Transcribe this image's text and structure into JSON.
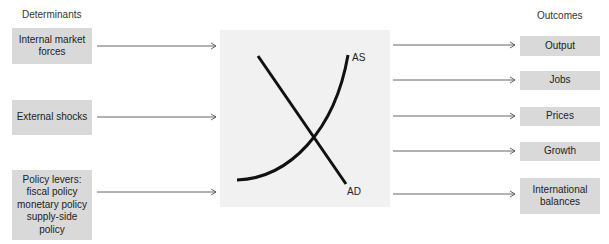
{
  "headings": {
    "determinants": "Determinants",
    "outcomes": "Outcomes"
  },
  "determinants": [
    {
      "label": "Internal market\nforces"
    },
    {
      "label": "External shocks"
    },
    {
      "label": "Policy levers:\nfiscal policy\nmonetary policy\nsupply-side\npolicy"
    }
  ],
  "outcomes": [
    {
      "label": "Output"
    },
    {
      "label": "Jobs"
    },
    {
      "label": "Prices"
    },
    {
      "label": "Growth"
    },
    {
      "label": "International\nbalances"
    }
  ],
  "diagram": {
    "as_label": "AS",
    "ad_label": "AD",
    "line_color": "#111111",
    "box_color": "#d9d9d9",
    "center_color": "#f1f1f1",
    "arrow_color": "#555555"
  }
}
